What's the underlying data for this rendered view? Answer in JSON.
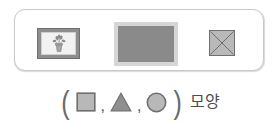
{
  "panel": {
    "border_color": "#c9c9c9",
    "items": [
      {
        "name": "framed-picture",
        "label": "framed plant picture",
        "frame_color": "#8e8e8e",
        "mat_color": "#f2f2f2",
        "art": "potted-plant"
      },
      {
        "name": "gray-rectangle",
        "label": "gray rectangle",
        "fill_color": "#8a8a8a",
        "border_color": "#d6d6d6"
      },
      {
        "name": "crossed-square",
        "label": "square with diagonal cross",
        "fill_color": "#b9b9b9",
        "border_color": "#6f6f6f",
        "cross": "X"
      }
    ]
  },
  "caption": {
    "open_paren": "(",
    "close_paren": ")",
    "separator": ",",
    "shapes": [
      {
        "name": "square",
        "glyph": "■",
        "fill": "#b5b5b5",
        "stroke": "#6f6f6f"
      },
      {
        "name": "triangle",
        "glyph": "▲",
        "fill": "#8f8f8f",
        "stroke": "#6f6f6f"
      },
      {
        "name": "circle",
        "glyph": "●",
        "fill": "#b5b5b5",
        "stroke": "#6f6f6f"
      }
    ],
    "word": "모양",
    "full_text": "( ■ , ▲ , ● ) 모양"
  }
}
